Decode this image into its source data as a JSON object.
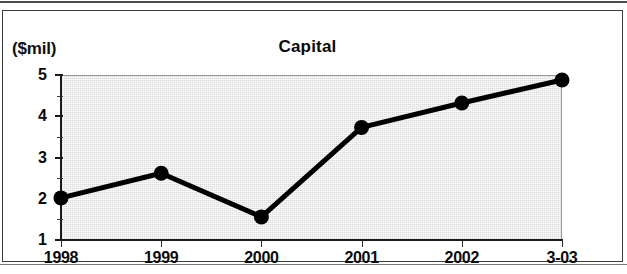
{
  "chart_data": {
    "type": "line",
    "title": "Capital",
    "xlabel": "",
    "ylabel": "($mil)",
    "categories": [
      "1998",
      "1999",
      "2000",
      "2001",
      "2002",
      "3-03"
    ],
    "values": [
      2.02,
      2.62,
      1.56,
      3.73,
      4.32,
      4.88
    ],
    "series": [
      {
        "name": "Capital",
        "values": [
          2.02,
          2.62,
          1.56,
          3.73,
          4.32,
          4.88
        ]
      }
    ],
    "ylim": [
      1,
      5
    ],
    "ytick_labels": [
      "1",
      "2",
      "3",
      "4",
      "5"
    ],
    "ytick_values": [
      1,
      2,
      3,
      4,
      5
    ],
    "yminor_tick_values": [
      1.5,
      2.5,
      3.5,
      4.5
    ],
    "grid": false,
    "legend": "none",
    "marker": "filled-circle",
    "plot_background": "#d9d9d9",
    "line_color": "#000000"
  },
  "figure": {
    "units_label": "($mil)",
    "title": "Capital"
  }
}
